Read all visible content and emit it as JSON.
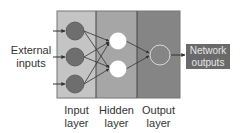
{
  "diagram": {
    "type": "neural-network",
    "labels": {
      "external_inputs_line1": "External",
      "external_inputs_line2": "inputs",
      "network_outputs_line1": "Network",
      "network_outputs_line2": "outputs",
      "input_layer_line1": "Input",
      "input_layer_line2": "layer",
      "hidden_layer_line1": "Hidden",
      "hidden_layer_line2": "layer",
      "output_layer_line1": "Output",
      "output_layer_line2": "layer"
    },
    "layers": [
      {
        "name": "Input layer",
        "nodes": 3,
        "panel_color": "#c4c4c4",
        "node_color": "#6e6e6e"
      },
      {
        "name": "Hidden layer",
        "nodes": 2,
        "panel_color": "#a6a6a6",
        "node_color": "#ffffff"
      },
      {
        "name": "Output layer",
        "nodes": 1,
        "panel_color": "#858585",
        "node_color": "hollow"
      }
    ],
    "output_box_color": "#6a6a6a"
  }
}
